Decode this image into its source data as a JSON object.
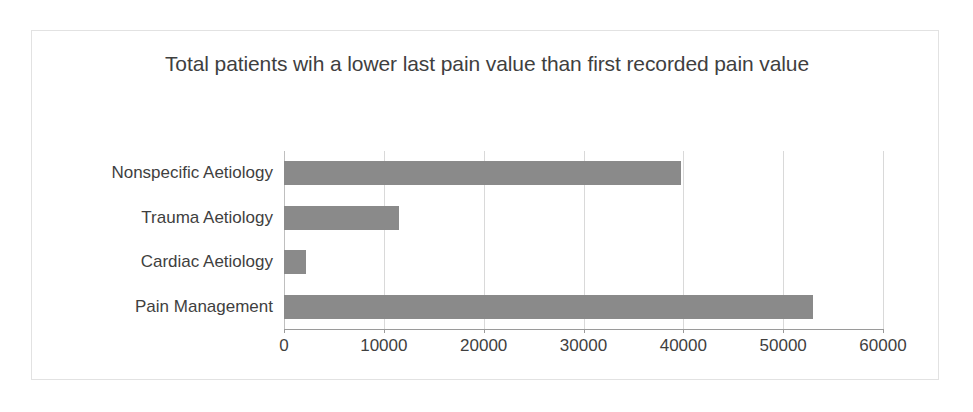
{
  "chart_data": {
    "type": "bar",
    "orientation": "horizontal",
    "title": "Total patients wih a lower last pain value than first recorded pain value",
    "categories": [
      "Pain Management",
      "Cardiac Aetiology",
      "Trauma Aetiology",
      "Nonspecific Aetiology"
    ],
    "values": [
      53000,
      2200,
      11500,
      39800
    ],
    "xlabel": "",
    "ylabel": "",
    "xlim": [
      0,
      60000
    ],
    "xticks": [
      0,
      10000,
      20000,
      30000,
      40000,
      50000,
      60000
    ],
    "xtick_labels": [
      "0",
      "10000",
      "20000",
      "30000",
      "40000",
      "50000",
      "60000"
    ],
    "grid": "vertical",
    "legend": "none",
    "bar_color": "#8a8a8a",
    "text_color": "#3f3f3f",
    "gridline_color": "#d9d9d9",
    "frame_border_color": "#e2e2e2",
    "background": "#ffffff"
  }
}
